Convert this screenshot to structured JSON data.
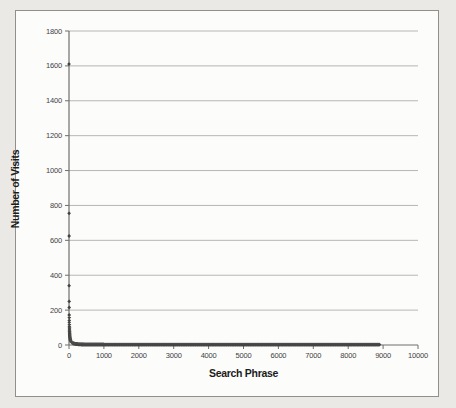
{
  "figure": {
    "page_background": "#ebe9e5",
    "frame_background": "#fcfcfb",
    "frame_border_color": "#918f8b"
  },
  "chart_data": {
    "type": "scatter",
    "title": "",
    "xlabel": "Search Phrase",
    "ylabel": "Number of Visits",
    "xlim": [
      0,
      10000
    ],
    "ylim": [
      0,
      1800
    ],
    "x_ticks": [
      0,
      1000,
      2000,
      3000,
      4000,
      5000,
      6000,
      7000,
      8000,
      9000,
      10000
    ],
    "y_ticks": [
      0,
      200,
      400,
      600,
      800,
      1000,
      1200,
      1400,
      1600,
      1800
    ],
    "grid": "horizontal-only",
    "legend": "none",
    "head_points": [
      [
        1,
        1610
      ],
      [
        2,
        755
      ],
      [
        3,
        625
      ],
      [
        4,
        340
      ],
      [
        5,
        250
      ],
      [
        6,
        215
      ],
      [
        7,
        172
      ],
      [
        8,
        158
      ],
      [
        9,
        140
      ]
    ],
    "tail": {
      "from_rank": 10,
      "to_rank": 8900,
      "start_value": 130,
      "decay_exponent": 1.05,
      "min_value": 2.5
    },
    "marker": {
      "shape": "diamond",
      "color": "#3c3c3c",
      "size_px": 3.8
    },
    "axis_color": "#6e6e6e",
    "gridline_color": "#b8b6b2",
    "tick_label_color": "#3f3f3f",
    "axis_title_color": "#1c1c1c"
  }
}
